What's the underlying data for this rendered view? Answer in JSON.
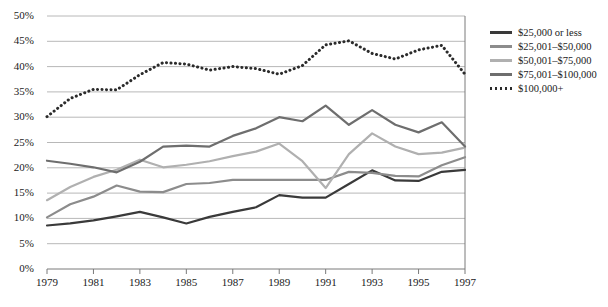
{
  "chart_data": {
    "type": "line",
    "title": "",
    "xlabel": "",
    "ylabel": "",
    "xlim": [
      1979,
      1997
    ],
    "ylim": [
      0,
      50
    ],
    "ytick_step": 5,
    "ytick_labels": [
      "0%",
      "5%",
      "10%",
      "15%",
      "20%",
      "25%",
      "30%",
      "35%",
      "40%",
      "45%",
      "50%"
    ],
    "ytick_values": [
      0,
      5,
      10,
      15,
      20,
      25,
      30,
      35,
      40,
      45,
      50
    ],
    "x": [
      1979,
      1980,
      1981,
      1982,
      1983,
      1984,
      1985,
      1986,
      1987,
      1988,
      1989,
      1990,
      1991,
      1992,
      1993,
      1994,
      1995,
      1996,
      1997
    ],
    "xtick_labels": [
      "1979",
      "1981",
      "1983",
      "1985",
      "1987",
      "1989",
      "1991",
      "1993",
      "1995",
      "1997"
    ],
    "xtick_values": [
      1979,
      1981,
      1983,
      1985,
      1987,
      1989,
      1991,
      1993,
      1995,
      1997
    ],
    "grid": "horizontal",
    "legend_position": "right",
    "series": [
      {
        "name": "$25,000 or less",
        "color": "#3a3a3a",
        "style": "solid",
        "width": 2.2,
        "values": [
          8.6,
          9.0,
          9.6,
          10.4,
          11.3,
          10.2,
          9.0,
          10.3,
          11.3,
          12.2,
          14.6,
          14.1,
          14.1,
          16.8,
          19.5,
          17.5,
          17.4,
          19.2,
          19.6
        ]
      },
      {
        "name": "$25,001–$50,000",
        "color": "#8c8c8c",
        "style": "solid",
        "width": 2.2,
        "values": [
          10.2,
          12.8,
          14.3,
          16.5,
          15.3,
          15.2,
          16.8,
          17.0,
          17.6,
          17.6,
          17.6,
          17.6,
          17.6,
          19.2,
          19.0,
          18.4,
          18.3,
          20.5,
          22.1
        ]
      },
      {
        "name": "$50,001–$75,000",
        "color": "#b0b0b0",
        "style": "solid",
        "width": 2.2,
        "values": [
          13.6,
          16.2,
          18.2,
          19.6,
          21.6,
          20.1,
          20.6,
          21.3,
          22.3,
          23.2,
          24.8,
          21.3,
          16.0,
          22.7,
          26.8,
          24.2,
          22.7,
          23.0,
          24.0
        ]
      },
      {
        "name": "$75,001–$100,000",
        "color": "#6e6e6e",
        "style": "solid",
        "width": 2.2,
        "values": [
          21.4,
          20.8,
          20.1,
          19.1,
          21.2,
          24.2,
          24.4,
          24.2,
          26.3,
          27.8,
          30.0,
          29.2,
          32.3,
          28.5,
          31.4,
          28.5,
          27.0,
          29.0,
          24.2
        ]
      },
      {
        "name": "$100,000+",
        "color": "#2b2b2b",
        "style": "dotted",
        "width": 3.0,
        "values": [
          30.1,
          33.7,
          35.5,
          35.4,
          38.4,
          40.8,
          40.5,
          39.3,
          40.0,
          39.6,
          38.5,
          40.2,
          44.3,
          45.1,
          42.6,
          41.5,
          43.3,
          44.2,
          38.5
        ]
      }
    ]
  },
  "legend": {
    "items": [
      {
        "label": "$25,000 or less"
      },
      {
        "label": "$25,001–$50,000"
      },
      {
        "label": "$50,001–$75,000"
      },
      {
        "label": "$75,001–$100,000"
      },
      {
        "label": "$100,000+"
      }
    ]
  }
}
